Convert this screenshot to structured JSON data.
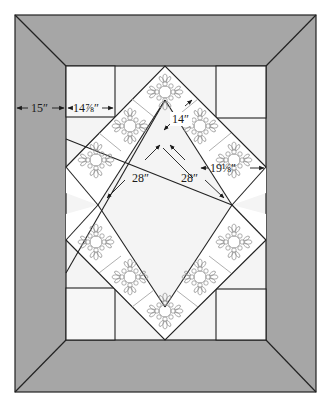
{
  "diagram": {
    "colors": {
      "border": "#a6a6a6",
      "background": "#f4f4f4",
      "block": "#ffffff",
      "line": "#222222",
      "motif": "#8e8e8e"
    },
    "measurements": {
      "border_width": "15″",
      "corner_square": "14⅞″",
      "block_size": "14″",
      "inner_left": "28″",
      "inner_right": "28″",
      "side_gap": "19⅛″"
    },
    "blocks": {
      "count": 12,
      "motif": "appliqué wreath block"
    }
  }
}
